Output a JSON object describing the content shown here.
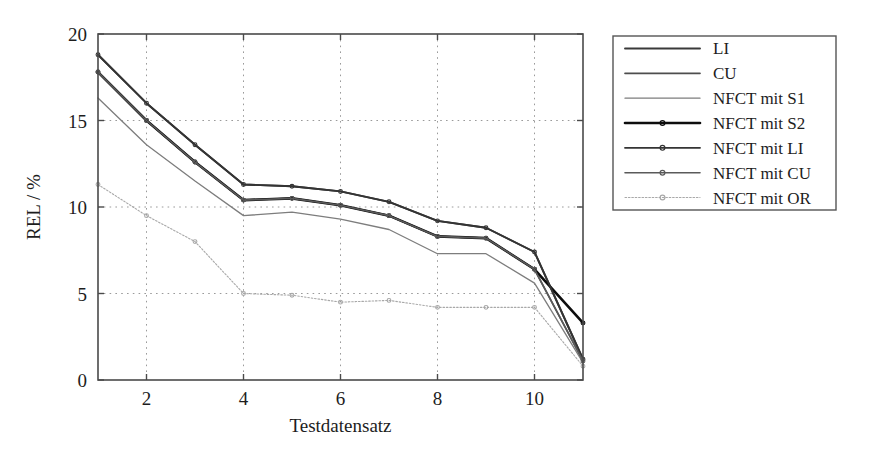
{
  "figure": {
    "background_color": "#ffffff",
    "frame_color": "#4a4a4a",
    "grid_color": "#9a9a9a"
  },
  "chart_data": {
    "type": "line",
    "title": "",
    "xlabel": "Testdatensatz",
    "ylabel": "REL / %",
    "xlim": [
      1,
      11
    ],
    "ylim": [
      0,
      20
    ],
    "xticks": [
      2,
      4,
      6,
      8,
      10
    ],
    "xtick_labels": [
      "2",
      "4",
      "6",
      "8",
      "10"
    ],
    "yticks": [
      0,
      5,
      10,
      15,
      20
    ],
    "ytick_labels": [
      "0",
      "5",
      "10",
      "15",
      "20"
    ],
    "grid": true,
    "grid_style": "dotted",
    "legend_position": "right-outside",
    "x": [
      1,
      2,
      3,
      4,
      5,
      6,
      7,
      8,
      9,
      10,
      11
    ],
    "series": [
      {
        "name": "LI",
        "values": [
          18.8,
          16.0,
          13.6,
          11.3,
          11.2,
          10.9,
          10.3,
          9.2,
          8.8,
          7.4,
          1.2
        ],
        "color": "#3a3a3a",
        "width": 1.9,
        "dash": "none",
        "marker": "none"
      },
      {
        "name": "CU",
        "values": [
          17.8,
          15.0,
          12.6,
          10.4,
          10.5,
          10.1,
          9.5,
          8.3,
          8.2,
          6.4,
          1.1
        ],
        "color": "#4d4d4d",
        "width": 1.7,
        "dash": "none",
        "marker": "none"
      },
      {
        "name": "NFCT mit S1",
        "values": [
          16.3,
          13.6,
          11.5,
          9.5,
          9.7,
          9.3,
          8.7,
          7.3,
          7.3,
          5.6,
          1.0
        ],
        "color": "#7d7d7d",
        "width": 1.3,
        "dash": "none",
        "marker": "none"
      },
      {
        "name": "NFCT mit S2",
        "values": [
          17.8,
          15.0,
          12.6,
          10.4,
          10.5,
          10.1,
          9.5,
          8.3,
          8.2,
          6.4,
          3.3
        ],
        "color": "#0d0d0d",
        "width": 2.6,
        "dash": "none",
        "marker": "dot"
      },
      {
        "name": "NFCT mit LI",
        "values": [
          18.8,
          16.0,
          13.6,
          11.3,
          11.2,
          10.9,
          10.3,
          9.2,
          8.8,
          7.4,
          1.2
        ],
        "color": "#343434",
        "width": 1.9,
        "dash": "none",
        "marker": "dot"
      },
      {
        "name": "NFCT mit CU",
        "values": [
          17.8,
          15.0,
          12.6,
          10.4,
          10.5,
          10.1,
          9.5,
          8.3,
          8.2,
          6.4,
          1.1
        ],
        "color": "#5a5a5a",
        "width": 1.6,
        "dash": "none",
        "marker": "dot"
      },
      {
        "name": "NFCT mit OR",
        "values": [
          11.3,
          9.5,
          8.0,
          5.0,
          4.9,
          4.5,
          4.6,
          4.2,
          4.2,
          4.2,
          0.8
        ],
        "color": "#a8a8a8",
        "width": 1.1,
        "dash": "1.6 1.8",
        "marker": "dot"
      }
    ]
  },
  "legend": {
    "entries": [
      {
        "label": "LI"
      },
      {
        "label": "CU"
      },
      {
        "label": "NFCT mit S1"
      },
      {
        "label": "NFCT mit S2"
      },
      {
        "label": "NFCT mit LI"
      },
      {
        "label": "NFCT mit CU"
      },
      {
        "label": "NFCT mit OR"
      }
    ]
  }
}
